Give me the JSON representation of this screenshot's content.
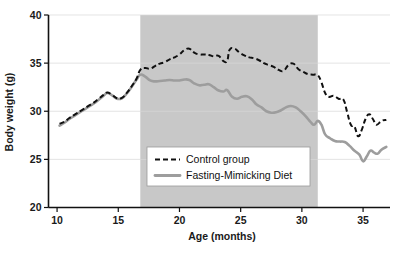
{
  "chart_data": {
    "type": "line",
    "title": "",
    "xlabel": "Age (months)",
    "ylabel": "Body weight (g)",
    "xlim": [
      9.3,
      37.2
    ],
    "ylim": [
      20,
      40
    ],
    "xticks": [
      10,
      15,
      20,
      25,
      30,
      35
    ],
    "yticks": [
      20,
      25,
      30,
      35,
      40
    ],
    "grid": true,
    "legend_position": "lower-center",
    "shaded_region": {
      "label": "",
      "x_start": 16.8,
      "x_end": 31.3,
      "color": "#c8c8c8"
    },
    "series": [
      {
        "name": "Control group",
        "style": "dashed",
        "color": "#101010",
        "x": [
          10.2,
          10.6,
          11.0,
          11.5,
          12.0,
          12.5,
          13.0,
          13.4,
          13.8,
          14.1,
          14.5,
          14.9,
          15.3,
          15.7,
          16.1,
          16.5,
          16.8,
          17.2,
          17.6,
          18.0,
          18.4,
          18.8,
          19.2,
          19.6,
          20.0,
          20.4,
          20.8,
          21.2,
          21.6,
          22.0,
          22.4,
          22.8,
          23.2,
          23.6,
          23.9,
          24.1,
          24.5,
          24.9,
          25.3,
          25.7,
          26.1,
          26.5,
          26.9,
          27.3,
          27.7,
          28.1,
          28.5,
          28.9,
          29.3,
          29.7,
          30.1,
          30.5,
          30.9,
          31.3,
          31.6,
          31.9,
          32.2,
          32.6,
          33.0,
          33.4,
          33.7,
          34.0,
          34.3,
          34.6,
          34.9,
          35.2,
          35.5,
          35.8,
          36.1,
          36.5,
          36.9
        ],
        "y": [
          28.7,
          28.9,
          29.3,
          29.7,
          30.1,
          30.5,
          30.9,
          31.3,
          31.7,
          31.95,
          31.7,
          31.35,
          31.4,
          31.9,
          32.6,
          33.4,
          34.3,
          34.5,
          34.4,
          34.7,
          34.95,
          35.1,
          35.4,
          35.6,
          35.9,
          36.35,
          36.5,
          36.1,
          35.9,
          35.9,
          35.85,
          35.7,
          35.75,
          35.2,
          35.25,
          36.4,
          36.5,
          36.1,
          35.8,
          35.6,
          35.5,
          35.3,
          35.0,
          34.8,
          34.6,
          34.3,
          34.2,
          34.8,
          34.95,
          34.4,
          34.1,
          33.85,
          33.8,
          33.75,
          33.0,
          31.9,
          31.5,
          31.6,
          31.3,
          31.2,
          29.9,
          28.6,
          28.4,
          27.4,
          28.1,
          29.2,
          29.7,
          29.2,
          28.6,
          29.0,
          29.1
        ]
      },
      {
        "name": "Fasting-Mimicking Diet",
        "style": "solid",
        "color": "#9d9d9d",
        "x": [
          10.2,
          10.6,
          11.0,
          11.5,
          12.0,
          12.5,
          13.0,
          13.4,
          13.8,
          14.1,
          14.5,
          14.9,
          15.3,
          15.7,
          16.1,
          16.5,
          16.8,
          17.2,
          17.6,
          18.0,
          18.4,
          18.8,
          19.2,
          19.6,
          20.0,
          20.4,
          20.8,
          21.2,
          21.6,
          22.0,
          22.4,
          22.8,
          23.2,
          23.6,
          23.9,
          24.3,
          24.7,
          25.1,
          25.5,
          25.9,
          26.3,
          26.7,
          27.1,
          27.5,
          27.9,
          28.3,
          28.7,
          29.1,
          29.5,
          29.9,
          30.3,
          30.7,
          31.0,
          31.3,
          31.6,
          31.9,
          32.3,
          32.7,
          33.1,
          33.5,
          33.9,
          34.3,
          34.7,
          35.0,
          35.3,
          35.6,
          35.9,
          36.2,
          36.5,
          36.9
        ],
        "y": [
          28.5,
          28.8,
          29.2,
          29.6,
          30.0,
          30.4,
          30.8,
          31.2,
          31.6,
          31.9,
          31.65,
          31.3,
          31.35,
          31.85,
          32.55,
          33.3,
          33.8,
          33.6,
          33.2,
          33.1,
          33.15,
          33.2,
          33.25,
          33.2,
          33.2,
          33.3,
          33.25,
          32.9,
          32.7,
          32.75,
          32.8,
          32.5,
          32.15,
          32.05,
          32.2,
          31.5,
          31.3,
          31.5,
          31.55,
          31.25,
          30.7,
          30.4,
          30.0,
          29.85,
          29.9,
          30.1,
          30.4,
          30.55,
          30.4,
          30.0,
          29.5,
          28.9,
          28.6,
          29.0,
          28.6,
          27.6,
          27.2,
          26.9,
          26.85,
          26.8,
          26.4,
          25.9,
          25.5,
          24.8,
          25.3,
          25.9,
          25.7,
          25.6,
          26.0,
          26.3
        ]
      }
    ]
  },
  "legend": {
    "entries": [
      {
        "label": "Control group",
        "swatch": "dashed-line-swatch"
      },
      {
        "label": "Fasting-Mimicking Diet",
        "swatch": "solid-line-swatch"
      }
    ]
  },
  "axes": {
    "y_title": "Body weight (g)",
    "x_title": "Age (months)",
    "y_tick_labels": [
      "20",
      "25",
      "30",
      "35",
      "40"
    ],
    "x_tick_labels": [
      "10",
      "15",
      "20",
      "25",
      "30",
      "35"
    ]
  },
  "colors": {
    "control": "#101010",
    "fmd": "#9d9d9d",
    "shade": "#c8c8c8",
    "grid": "#d8d8d8",
    "axis": "#111111"
  }
}
